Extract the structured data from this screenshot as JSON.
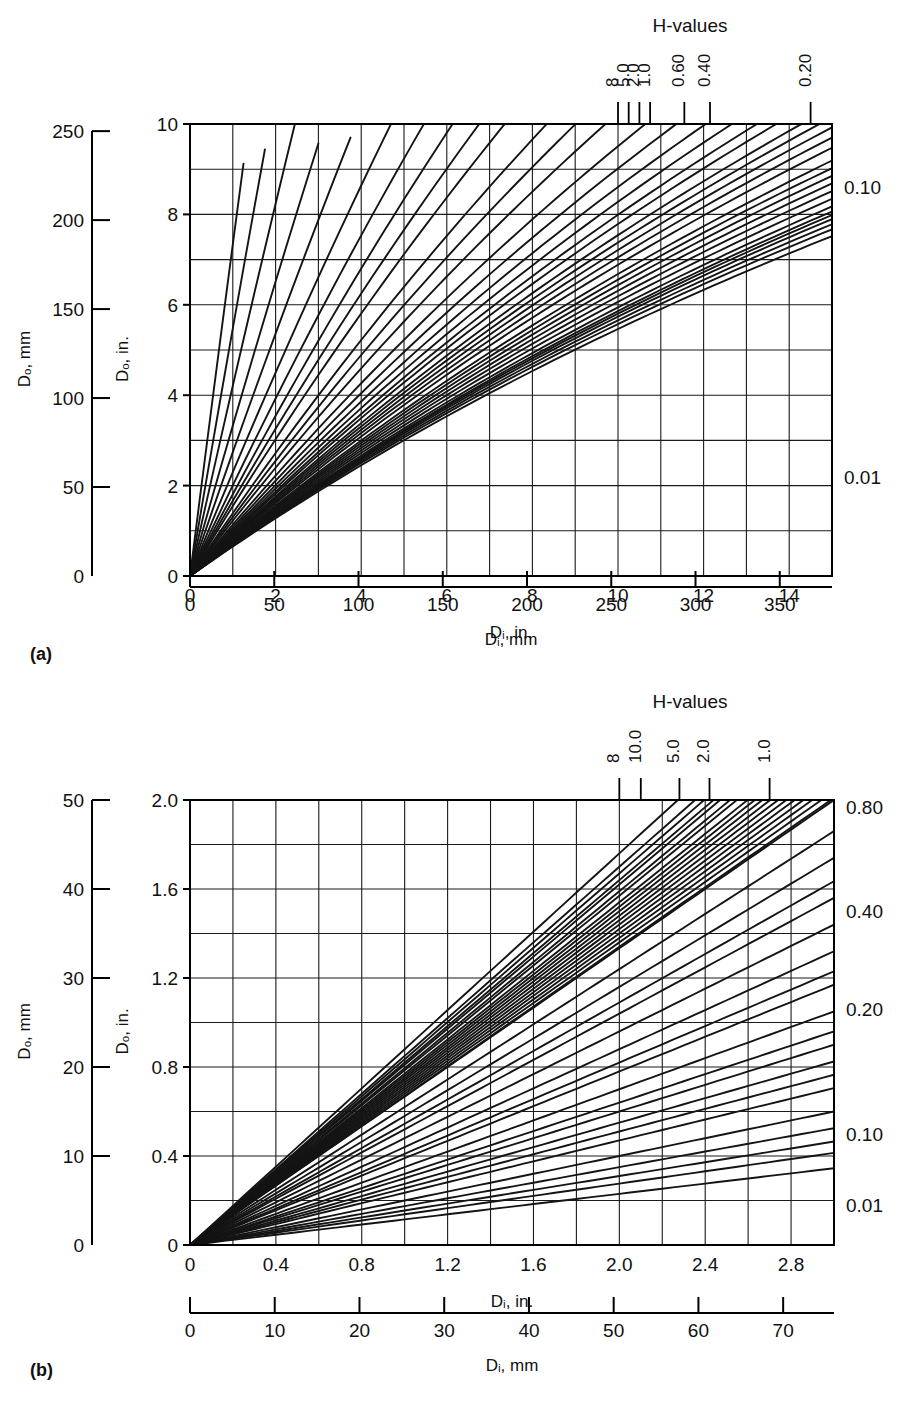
{
  "figure": {
    "panels": [
      {
        "id": "a",
        "panel_label": "(a)",
        "header": "H-values",
        "left_axis_mm_title": "Dₒ, mm",
        "left_axis_in_title": "Dₒ, in.",
        "bottom_axis_in_title": "Dᵢ, in.",
        "bottom_axis_mm_title": "Dᵢ, mm",
        "y_mm_ticks": [
          0,
          50,
          100,
          150,
          200,
          250
        ],
        "y_in_ticks": [
          0,
          2,
          4,
          6,
          8,
          10
        ],
        "x_in_ticks": [
          0,
          2,
          4,
          6,
          8,
          10,
          12,
          14
        ],
        "x_mm_ticks": [
          0,
          50,
          100,
          150,
          200,
          250,
          300,
          350
        ],
        "top_h_labels": [
          "8",
          "5.0",
          "2.0",
          "1.0",
          "0.60",
          "0.40",
          "0.20"
        ],
        "right_h_labels": [
          "0.10",
          "0.01"
        ]
      },
      {
        "id": "b",
        "panel_label": "(b)",
        "header": "H-values",
        "left_axis_mm_title": "Dₒ, mm",
        "left_axis_in_title": "Dₒ, in.",
        "bottom_axis_in_title": "Dᵢ, in.",
        "bottom_axis_mm_title": "Dᵢ, mm",
        "y_mm_ticks": [
          0,
          10,
          20,
          30,
          40,
          50
        ],
        "y_in_ticks": [
          "0",
          "0.4",
          "0.8",
          "1.2",
          "1.6",
          "2.0"
        ],
        "x_in_ticks": [
          "0",
          "0.4",
          "0.8",
          "1.2",
          "1.6",
          "2.0",
          "2.4",
          "2.8"
        ],
        "x_mm_ticks": [
          0,
          10,
          20,
          30,
          40,
          50,
          60,
          70
        ],
        "top_h_labels": [
          "8",
          "10.0",
          "5.0",
          "2.0",
          "1.0"
        ],
        "right_h_labels": [
          "0.80",
          "0.40",
          "0.20",
          "0.10",
          "0.01"
        ]
      }
    ]
  },
  "chart_data": [
    {
      "type": "line",
      "panel": "a",
      "title": "H-values",
      "xlabel": "Dᵢ, in.",
      "ylabel": "Dₒ, in.",
      "xlabel_secondary": "Dᵢ, mm",
      "ylabel_secondary": "Dₒ, mm",
      "xlim": [
        0,
        15
      ],
      "ylim": [
        0,
        10
      ],
      "xlim_mm": [
        0,
        381
      ],
      "ylim_mm": [
        0,
        254
      ],
      "x_ticks": [
        0,
        2,
        4,
        6,
        8,
        10,
        12,
        14
      ],
      "y_ticks": [
        0,
        2,
        4,
        6,
        8,
        10
      ],
      "x_grid_step": 1,
      "y_grid_step": 1,
      "grid": true,
      "legend_position": "top-and-right-edge-annotations",
      "series_param": "H",
      "series": [
        {
          "name": "8",
          "H": 1000,
          "slope": 0.6667,
          "label_pos": "top",
          "label_x": 10.0
        },
        {
          "name": "5.0",
          "H": 5.0,
          "slope": 0.708,
          "label_pos": "top",
          "label_x": 10.25
        },
        {
          "name": "2.0",
          "H": 2.0,
          "slope": 0.77,
          "label_pos": "top",
          "label_x": 10.5
        },
        {
          "name": "1.0",
          "H": 1.0,
          "slope": 0.84,
          "label_pos": "top",
          "label_x": 10.75
        },
        {
          "name": "0.60",
          "H": 0.6,
          "slope": 0.92,
          "label_pos": "top",
          "label_x": 11.55
        },
        {
          "name": "0.40",
          "H": 0.4,
          "slope": 1.01,
          "label_pos": "top",
          "label_x": 12.15
        },
        {
          "name": "0.20",
          "H": 0.2,
          "slope": 1.25,
          "label_pos": "top",
          "label_x": 14.5
        },
        {
          "name": "0.10",
          "H": 0.1,
          "slope": 1.58,
          "label_pos": "right",
          "label_y": 8.6
        },
        {
          "name": "0.01",
          "H": 0.01,
          "slope": 7.5,
          "label_pos": "right",
          "label_y": 2.2
        }
      ],
      "intermediate_series_slopes": [
        0.68,
        0.69,
        0.7,
        0.715,
        0.725,
        0.74,
        0.755,
        0.785,
        0.8,
        0.815,
        0.86,
        0.88,
        0.9,
        0.95,
        0.975,
        1.05,
        1.1,
        1.16,
        1.33,
        1.42,
        1.7,
        1.85,
        2.05,
        2.35,
        2.8,
        3.4,
        4.3,
        5.6
      ]
    },
    {
      "type": "line",
      "panel": "b",
      "title": "H-values",
      "xlabel": "Dᵢ, in.",
      "ylabel": "Dₒ, in.",
      "xlabel_secondary": "Dᵢ, mm",
      "ylabel_secondary": "Dₒ, mm",
      "xlim": [
        0,
        3.0
      ],
      "ylim": [
        0,
        2.0
      ],
      "xlim_mm": [
        0,
        76
      ],
      "ylim_mm": [
        0,
        50
      ],
      "x_ticks": [
        0,
        0.4,
        0.8,
        1.2,
        1.6,
        2.0,
        2.4,
        2.8
      ],
      "y_ticks": [
        0,
        0.4,
        0.8,
        1.2,
        1.6,
        2.0
      ],
      "x_grid_step": 0.2,
      "y_grid_step": 0.2,
      "grid": true,
      "legend_position": "top-and-right-edge-annotations",
      "series_param": "H",
      "series": [
        {
          "name": "8",
          "H": 1000,
          "slope": 0.6667,
          "label_pos": "top",
          "label_x": 2.0
        },
        {
          "name": "10.0",
          "H": 10.0,
          "slope": 0.7,
          "label_pos": "top",
          "label_x": 2.1
        },
        {
          "name": "5.0",
          "H": 5.0,
          "slope": 0.75,
          "label_pos": "top",
          "label_x": 2.28
        },
        {
          "name": "2.0",
          "H": 2.0,
          "slope": 0.81,
          "label_pos": "top",
          "label_x": 2.42
        },
        {
          "name": "1.0",
          "H": 1.0,
          "slope": 0.88,
          "label_pos": "top",
          "label_x": 2.7
        },
        {
          "name": "0.80",
          "H": 0.8,
          "slope": 0.67,
          "label_pos": "right",
          "label_y": 1.97
        },
        {
          "name": "0.40",
          "H": 0.4,
          "slope": 0.48,
          "label_pos": "right",
          "label_y": 1.5
        },
        {
          "name": "0.20",
          "H": 0.2,
          "slope": 0.35,
          "label_pos": "right",
          "label_y": 1.06
        },
        {
          "name": "0.10",
          "H": 0.1,
          "slope": 0.2,
          "label_pos": "right",
          "label_y": 0.5
        },
        {
          "name": "0.01",
          "H": 0.01,
          "slope": 0.115,
          "label_pos": "right",
          "label_y": 0.18
        }
      ],
      "intermediate_series_slopes": [
        0.68,
        0.69,
        0.71,
        0.72,
        0.73,
        0.74,
        0.76,
        0.77,
        0.785,
        0.795,
        0.82,
        0.835,
        0.85,
        0.62,
        0.58,
        0.545,
        0.52,
        0.44,
        0.41,
        0.39,
        0.32,
        0.3,
        0.275,
        0.255,
        0.235,
        0.175,
        0.155,
        0.138
      ]
    }
  ]
}
